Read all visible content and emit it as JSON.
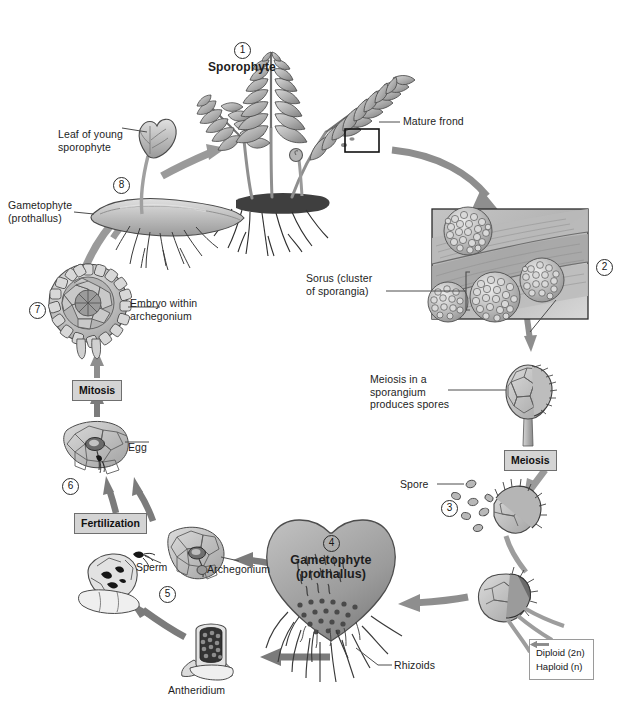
{
  "diagram": {
    "type": "biological-life-cycle-diagram",
    "background": "#ffffff"
  },
  "stages": [
    {
      "number": "1",
      "label": "Sporophyte",
      "phase": "Diploid (2n)",
      "sublabels": [
        "Mature frond"
      ]
    },
    {
      "number": "2",
      "label": "",
      "phase": "Diploid (2n)",
      "sublabels": [
        "Sorus (cluster\nof sporangia)"
      ]
    },
    {
      "number": "3",
      "label": "",
      "phase": "Haploid (n)",
      "sublabels": [
        "Spore",
        "Meiosis in a\nsporangium\nproduces spores"
      ]
    },
    {
      "number": "4",
      "label": "Gametophyte\n(prothallus)",
      "phase": "Haploid (n)",
      "sublabels": [
        "Rhizoids",
        "Antheridium",
        "Archegonium"
      ]
    },
    {
      "number": "5",
      "label": "",
      "phase": "Haploid (n)",
      "sublabels": [
        "Sperm"
      ]
    },
    {
      "number": "6",
      "label": "",
      "phase": "Haploid (n)",
      "sublabels": [
        "Egg"
      ]
    },
    {
      "number": "7",
      "label": "",
      "phase": "Diploid (2n)",
      "sublabels": [
        "Embryo within\narchegonium"
      ]
    },
    {
      "number": "8",
      "label": "",
      "phase": "Diploid (2n)",
      "sublabels": [
        "Leaf of young\nsporophyte",
        "Gametophyte\n(prothallus)"
      ]
    }
  ],
  "labels": {
    "sporophyte": "Sporophyte",
    "mature_frond": "Mature frond",
    "sorus": "Sorus (cluster\nof sporangia)",
    "meiosis_sporangium": "Meiosis in a\nsporangium\nproduces spores",
    "spore": "Spore",
    "gametophyte_title": "Gametophyte",
    "gametophyte_sub": "(prothallus)",
    "rhizoids": "Rhizoids",
    "antheridium": "Antheridium",
    "archegonium": "Archegonium",
    "sperm": "Sperm",
    "egg": "Egg",
    "embryo": "Embryo within\narchegonium",
    "leaf_young_sporophyte": "Leaf of young\nsporophyte",
    "gametophyte_prothallus_left": "Gametophyte\n(prothallus)"
  },
  "processes": [
    {
      "id": "meiosis-right",
      "label": "Meiosis"
    },
    {
      "id": "fertilization",
      "label": "Fertilization"
    },
    {
      "id": "mitosis",
      "label": "Mitosis"
    }
  ],
  "numbers": {
    "n1": "1",
    "n2": "2",
    "n3": "3",
    "n4": "4",
    "n5": "5",
    "n6": "6",
    "n7": "7",
    "n8": "8"
  },
  "legend": {
    "items": [
      {
        "label": "Diploid (2n)",
        "color": "#8b8b8b"
      },
      {
        "label": "Haploid (n)",
        "color": "#8b8b8b"
      }
    ]
  },
  "colors": {
    "arrow_gray": "#8e8e8e",
    "arrow_dark": "#6e6e6e",
    "line": "#4c4c4c",
    "box_fill": "#d4d4d4",
    "box_stroke": "#6f6f6f",
    "plant_light": "#c7c7c7",
    "plant_mid": "#9d9d9d",
    "plant_dark": "#6a6a6a",
    "outline": "#3a3a3a",
    "text": "#1a1a1a"
  }
}
